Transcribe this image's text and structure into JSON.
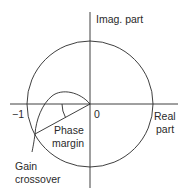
{
  "diagram": {
    "labels": {
      "imag_axis": "Imag. part",
      "real_axis_line1": "Real",
      "real_axis_line2": "part",
      "minus_one": "−1",
      "zero": "0",
      "phase_margin_line1": "Phase",
      "phase_margin_line2": "margin",
      "gain_crossover_line1": "Gain",
      "gain_crossover_line2": "crossover"
    },
    "colors": {
      "stroke": "#2a2a2a",
      "background": "#ffffff"
    }
  }
}
